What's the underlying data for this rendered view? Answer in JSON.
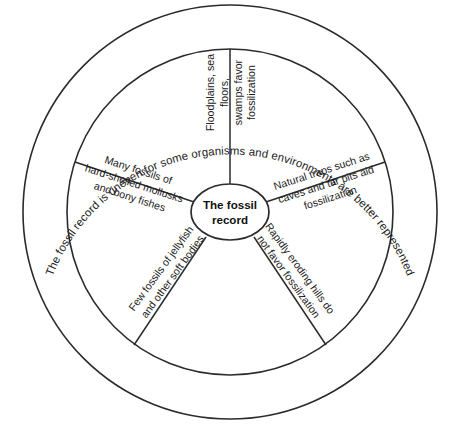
{
  "diagram": {
    "type": "circular-concept-wheel",
    "hub": {
      "line1": "The fossil",
      "line2": "record",
      "full_text": "The fossil record"
    },
    "outer_ring": {
      "text": "The fossil record is uneven for some organisms and environments are better represented"
    },
    "segments": [
      {
        "id": "floodplains",
        "position": "top",
        "text": "Floodplains, sea floors,\nswamps favor\nfossilization",
        "favors_fossilization": true
      },
      {
        "id": "natural-traps",
        "position": "upper-right",
        "text": "Natural traps such as\ncaves and tar pits aid\nfossilization",
        "favors_fossilization": true
      },
      {
        "id": "eroding-hills",
        "position": "lower-right",
        "text": "Rapidly eroding hills do\nnot favor fossilization",
        "favors_fossilization": false
      },
      {
        "id": "jellyfish",
        "position": "lower-left",
        "text": "Few fossils of jellyfish\nand other soft bodies",
        "favors_fossilization": false
      },
      {
        "id": "mollusks",
        "position": "upper-left",
        "text": "Many fossils of\nhard-shelled mollusks\nand bony fishes",
        "favors_fossilization": true
      }
    ]
  },
  "colors": {
    "stroke": "#2b2b2b",
    "background": "#ffffff",
    "text": "#1a1a1a"
  }
}
